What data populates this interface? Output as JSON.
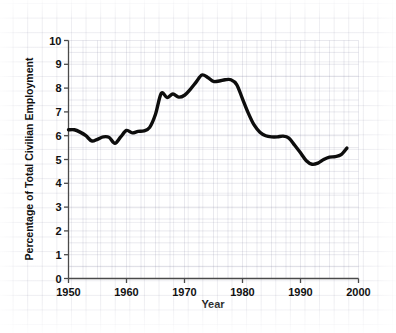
{
  "chart_data": {
    "type": "line",
    "title": "",
    "xlabel": "Year",
    "ylabel": "Percentage of Total Civilian Employment",
    "xlim": [
      1950,
      2000
    ],
    "ylim": [
      0,
      10
    ],
    "xticks": [
      1950,
      1960,
      1970,
      1980,
      1990,
      2000
    ],
    "xticklabels": [
      "1950",
      "1960",
      "1970",
      "1980",
      "1990",
      "2000"
    ],
    "yticks": [
      0,
      1,
      2,
      3,
      4,
      5,
      6,
      7,
      8,
      9,
      10
    ],
    "yticklabels": [
      "0",
      "1",
      "2",
      "3",
      "4",
      "5",
      "6",
      "7",
      "8",
      "9",
      "10"
    ],
    "grid": true,
    "legend": "none",
    "line_color": "#0d0d0d",
    "series": [
      {
        "name": "Percentage of Total Civilian Employment",
        "x": [
          1950,
          1951,
          1952,
          1953,
          1954,
          1955,
          1956,
          1957,
          1958,
          1959,
          1960,
          1961,
          1962,
          1963,
          1964,
          1965,
          1966,
          1967,
          1968,
          1969,
          1970,
          1971,
          1972,
          1973,
          1974,
          1975,
          1976,
          1977,
          1978,
          1979,
          1980,
          1981,
          1982,
          1983,
          1984,
          1985,
          1986,
          1987,
          1988,
          1989,
          1990,
          1991,
          1992,
          1993,
          1994,
          1995,
          1996,
          1997,
          1998
        ],
        "values": [
          6.25,
          6.25,
          6.15,
          6.0,
          5.78,
          5.85,
          5.95,
          5.93,
          5.68,
          5.95,
          6.22,
          6.12,
          6.18,
          6.2,
          6.35,
          6.9,
          7.78,
          7.6,
          7.75,
          7.62,
          7.7,
          7.95,
          8.25,
          8.55,
          8.45,
          8.28,
          8.3,
          8.35,
          8.35,
          8.15,
          7.55,
          6.95,
          6.45,
          6.15,
          6.0,
          5.95,
          5.95,
          5.98,
          5.9,
          5.6,
          5.28,
          4.95,
          4.8,
          4.85,
          5.0,
          5.1,
          5.12,
          5.2,
          5.48
        ]
      }
    ]
  },
  "axes": {
    "y_axis_title": "Percentage of Total Civilian Employment",
    "x_axis_title": "Year"
  }
}
